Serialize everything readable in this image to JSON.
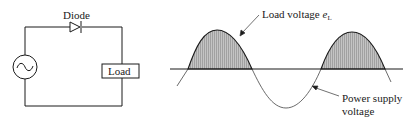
{
  "circuit": {
    "diode_label": "Diode",
    "load_label": "Load",
    "source_icon": "ac-source-icon"
  },
  "waveform": {
    "load_voltage_label": "Load voltage ",
    "load_voltage_symbol": "e",
    "load_voltage_subscript": "L",
    "supply_label_line1": "Power supply",
    "supply_label_line2": "voltage"
  },
  "colors": {
    "line": "#1a1a1a",
    "shade": "#a8a8a8"
  }
}
